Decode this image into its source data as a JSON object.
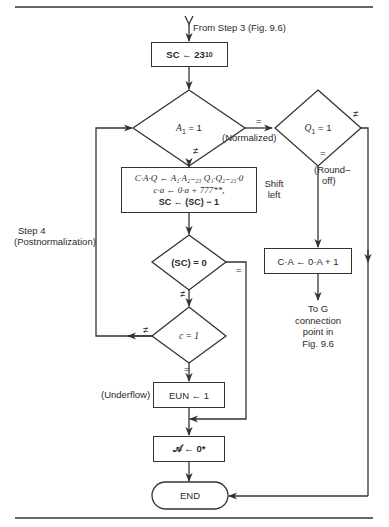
{
  "figure": {
    "entry_label": "From Step 3 (Fig. 9.6)",
    "step_label_line1": "Step 4",
    "step_label_line2": "(Postnormalization)",
    "nodes": {
      "init_sc": {
        "text": "SC ← 23",
        "subscript": "10"
      },
      "decision_a1": {
        "var": "A",
        "sub": "1",
        "rest": " = 1"
      },
      "decision_q1": {
        "var": "Q",
        "sub": "1",
        "rest": " = 1"
      },
      "shift_box": {
        "line1": "C·A·Q ← A₁·A₂₋₂₃ Q₁·Q₂₋₂₃·0",
        "line2": "c·a ← 0·a + 777**,",
        "line3": "SC ← (SC) − 1"
      },
      "shift_label_line1": "Shift",
      "shift_label_line2": "left",
      "decision_sc0": {
        "text": "(SC) = 0"
      },
      "decision_c1": {
        "text": "c = 1"
      },
      "underflow_box": {
        "text": "EUN ← 1"
      },
      "underflow_label": "(Underflow)",
      "zero_box": {
        "text": "𝒜 ← 0*"
      },
      "roundoff_box": {
        "text": "C·A ← 0·A + 1"
      },
      "roundoff_label_line1": "(Round–",
      "roundoff_label_line2": "off)",
      "normalized_label": "(Normalized)",
      "end": {
        "text": "END"
      },
      "exit_label_lines": [
        "To G",
        "connection",
        "point in",
        "Fig. 9.6"
      ]
    },
    "edge_labels": {
      "eq": "=",
      "neq": "≠"
    }
  }
}
